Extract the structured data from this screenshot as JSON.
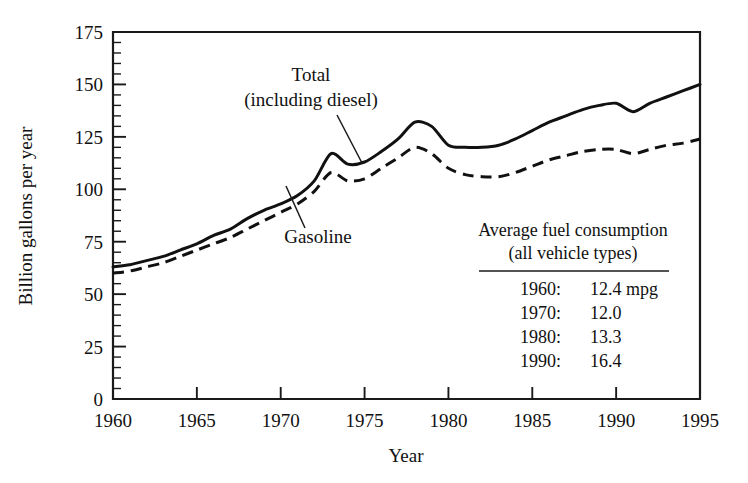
{
  "chart_data": {
    "type": "line",
    "title": "",
    "xlabel": "Year",
    "ylabel": "Billion gallons per year",
    "xlim": [
      1960,
      1995
    ],
    "ylim": [
      0,
      175
    ],
    "grid": false,
    "legend_position": "inline-annotations",
    "x_ticks": [
      1960,
      1965,
      1970,
      1975,
      1980,
      1985,
      1990,
      1995
    ],
    "y_ticks": [
      0,
      25,
      50,
      75,
      100,
      125,
      150,
      175
    ],
    "y_minor_tick_step": 5,
    "x": [
      1960,
      1961,
      1962,
      1963,
      1964,
      1965,
      1966,
      1967,
      1968,
      1969,
      1970,
      1971,
      1972,
      1973,
      1974,
      1975,
      1976,
      1977,
      1978,
      1979,
      1980,
      1981,
      1982,
      1983,
      1984,
      1985,
      1986,
      1987,
      1988,
      1989,
      1990,
      1991,
      1992,
      1993,
      1994,
      1995
    ],
    "series": [
      {
        "name": "Total (including diesel)",
        "style": "solid",
        "values": [
          63,
          64,
          66,
          68,
          71,
          74,
          78,
          81,
          86,
          90,
          93,
          97,
          104,
          117,
          112,
          113,
          118,
          124,
          132,
          130,
          121,
          120,
          120,
          121,
          124,
          128,
          132,
          135,
          138,
          140,
          141,
          137,
          141,
          144,
          147,
          150
        ]
      },
      {
        "name": "Gasoline",
        "style": "dashed",
        "values": [
          60,
          61,
          63,
          65,
          68,
          71,
          74,
          77,
          81,
          85,
          89,
          93,
          99,
          108,
          104,
          105,
          110,
          115,
          120,
          117,
          110,
          107,
          106,
          106,
          108,
          111,
          114,
          116,
          118,
          119,
          119,
          117,
          119,
          121,
          122,
          124
        ]
      }
    ],
    "annotations": [
      {
        "text_line1": "Total",
        "text_line2": "(including diesel)",
        "points_to": "total-series"
      },
      {
        "text_line1": "Gasoline",
        "text_line2": "",
        "points_to": "gasoline-series"
      }
    ]
  },
  "axes": {
    "y_label": "Billion gallons per year",
    "x_label": "Year",
    "y_tick_labels": [
      "0",
      "25",
      "50",
      "75",
      "100",
      "125",
      "150",
      "175"
    ],
    "x_tick_labels": [
      "1960",
      "1965",
      "1970",
      "1975",
      "1980",
      "1985",
      "1990",
      "1995"
    ]
  },
  "annotations": {
    "total_line1": "Total",
    "total_line2": "(including diesel)",
    "gasoline": "Gasoline"
  },
  "inset_table": {
    "title_line1": "Average fuel consumption",
    "title_line2": "(all vehicle types)",
    "rows": [
      {
        "year": "1960:",
        "value": "12.4 mpg"
      },
      {
        "year": "1970:",
        "value": "12.0"
      },
      {
        "year": "1980:",
        "value": "13.3"
      },
      {
        "year": "1990:",
        "value": "16.4"
      }
    ]
  },
  "colors": {
    "ink": "#111111",
    "background": "#ffffff"
  }
}
